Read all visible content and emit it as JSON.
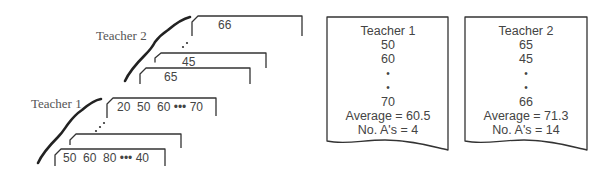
{
  "diagram": {
    "input_stacks": [
      {
        "label": "Teacher 2",
        "cards": [
          {
            "position": "front",
            "text": "65"
          },
          {
            "position": "second",
            "text": "45"
          },
          {
            "position": "ellipsis",
            "text": ".·"
          },
          {
            "position": "back",
            "text": "66"
          }
        ]
      },
      {
        "label": "Teacher 1",
        "cards": [
          {
            "position": "front",
            "text": "50  60  80 ••• 40"
          },
          {
            "position": "second",
            "text": ""
          },
          {
            "position": "ellipsis",
            "text": ".·"
          },
          {
            "position": "back",
            "text": "20  50  60 ••• 70"
          }
        ]
      }
    ],
    "reports": [
      {
        "title": "Teacher 1",
        "lines": [
          "50",
          "60",
          "•",
          "•",
          "70"
        ],
        "average_label": "Average = 60.5",
        "count_label": "No. A's = 4",
        "average": 60.5,
        "num_as": 4
      },
      {
        "title": "Teacher 2",
        "lines": [
          "65",
          "45",
          "•",
          "•",
          "66"
        ],
        "average_label": "Average = 71.3",
        "count_label": "No. A's = 14",
        "average": 71.3,
        "num_as": 14
      }
    ],
    "colors": {
      "ink": "#333333",
      "text": "#444444",
      "label": "#555555",
      "background": "#ffffff"
    }
  }
}
